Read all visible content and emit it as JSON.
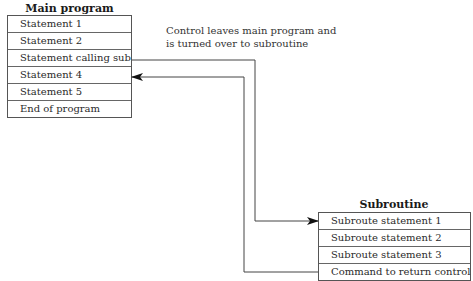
{
  "main_program": {
    "title": "Main program",
    "statements": [
      "Statement 1",
      "Statement 2",
      "Statement calling sub",
      "Statement 4",
      "Statement 5",
      "End of program"
    ]
  },
  "annotation": {
    "line1": "Control leaves main program and",
    "line2": "is turned over to subroutine"
  },
  "subroutine": {
    "title": "Subroutine",
    "statements": [
      "Subroute statement 1",
      "Subroute statement 2",
      "Subroute statement 3",
      "Command to return control"
    ]
  },
  "connectors": [
    {
      "from": "Statement calling sub",
      "to": "Subroute statement 1",
      "direction": "call"
    },
    {
      "from": "Command to return control",
      "to": "Statement 4",
      "direction": "return"
    }
  ]
}
